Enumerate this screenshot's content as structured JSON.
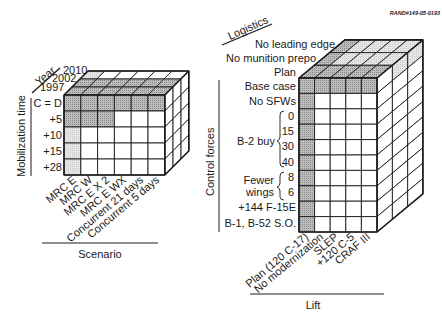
{
  "figure_id": "RAND#149-05-0193",
  "left_cube": {
    "depth_axis": {
      "title": "Year",
      "levels": [
        "1997",
        "2002",
        "2010"
      ]
    },
    "row_axis": {
      "title": "Mobilization time",
      "levels": [
        "C = D",
        "+5",
        "+10",
        "+15",
        "+28"
      ]
    },
    "col_axis": {
      "title": "Scenario",
      "levels": [
        "MRC E",
        "MRC W",
        "MRC E X 2",
        "MRC E WX",
        "Concurrent 21 days",
        "Concurrent 5 days"
      ]
    },
    "shaded": {
      "front_dark_rows": [
        0,
        1
      ],
      "front_dark_row1_cols": [
        0,
        1,
        2
      ],
      "front_light_col0_rows": [
        2,
        3,
        4
      ],
      "top_dark_layers": [
        0,
        1
      ],
      "top_light_layer2_cols": [
        0
      ]
    }
  },
  "right_cube": {
    "depth_axis": {
      "title": "Logistics",
      "levels": [
        "Plan",
        "No munition prepo",
        "No leading edge"
      ]
    },
    "row_axis": {
      "title": "Control forces",
      "levels": [
        "Base case",
        "No SFWs",
        "0",
        "15",
        "30",
        "40",
        "8",
        "6",
        "+144 F-15E",
        "B-1, B-52 S.O."
      ],
      "groups": [
        {
          "label": "B-2 buy",
          "rows": [
            "0",
            "15",
            "30",
            "40"
          ]
        },
        {
          "label": "Fewer wings",
          "line1": "Fewer",
          "line2": "wings",
          "rows": [
            "8",
            "6"
          ]
        }
      ]
    },
    "col_axis": {
      "title": "Lift",
      "levels": [
        "Plan (120 C-17)",
        "No modernization",
        "SLEP",
        "+120 C-5",
        "CRAF III"
      ]
    }
  },
  "colors": {
    "line": "#1a1a1a",
    "shade_dark": "#a8a8a8",
    "shade_light": "#dcdcdc",
    "background": "#ffffff"
  }
}
